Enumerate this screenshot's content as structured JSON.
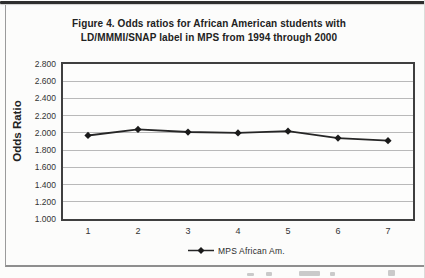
{
  "figure": {
    "title_line1": "Figure 4. Odds ratios for African American students with",
    "title_line2": "LD/MMMI/SNAP label in MPS from 1994 through 2000"
  },
  "axes": {
    "y_title": "Odds Ratio"
  },
  "legend": {
    "label": "MPS African Am."
  },
  "colors": {
    "series_line": "#262626",
    "marker": "#1a1a1a",
    "gridline": "#b9b9b9",
    "plot_border": "#3f3f3f",
    "text": "#2b2b2b",
    "frame_border": "#929292",
    "top_rule": "#2e2e2e",
    "background": "#fcfcfb"
  },
  "chart_data": {
    "type": "line",
    "title": "Figure 4. Odds ratios for African American students with LD/MMMI/SNAP label in MPS from 1994 through 2000",
    "categories": [
      "1",
      "2",
      "3",
      "4",
      "5",
      "6",
      "7"
    ],
    "series": [
      {
        "name": "MPS African Am.",
        "marker": "diamond",
        "values": [
          1.97,
          2.04,
          2.01,
          2.0,
          2.02,
          1.94,
          1.91
        ]
      }
    ],
    "xlabel": "",
    "ylabel": "Odds Ratio",
    "ylim": [
      1.0,
      2.8
    ],
    "ytick_step": 0.2,
    "ytick_labels": [
      "2.800",
      "2.600",
      "2.400",
      "2.200",
      "2.000",
      "1.800",
      "1.600",
      "1.400",
      "1.200",
      "1.000"
    ],
    "grid": true,
    "legend_position": "bottom"
  }
}
